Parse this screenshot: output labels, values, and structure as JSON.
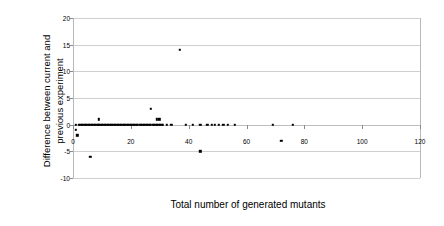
{
  "chart_data": {
    "type": "scatter",
    "title": "",
    "xlabel": "Total number of generated mutants",
    "ylabel": "Difference between current and previous experiment",
    "ylabel_line1": "Difference between current and",
    "ylabel_line2": "previous experiment",
    "xlim": [
      0,
      120
    ],
    "ylim": [
      -10,
      20
    ],
    "xticks": [
      0,
      20,
      40,
      60,
      80,
      100,
      120
    ],
    "yticks": [
      -10,
      -5,
      0,
      5,
      10,
      15,
      20
    ],
    "xtick_labels": [
      "0",
      "20",
      "40",
      "60",
      "80",
      "100",
      "120"
    ],
    "ytick_labels": [
      "-10",
      "-5",
      "0",
      "5",
      "10",
      "15",
      "20"
    ],
    "grid": "horizontal",
    "legend": "none",
    "marker": "square",
    "marker_color": "#000000",
    "marker_size": 2.4,
    "series": [
      {
        "name": "difference-per-mutant-count",
        "points": [
          [
            1,
            0
          ],
          [
            1,
            -1
          ],
          [
            1.5,
            -2
          ],
          [
            2,
            0
          ],
          [
            2.5,
            0
          ],
          [
            3,
            0
          ],
          [
            3.5,
            0
          ],
          [
            4,
            0
          ],
          [
            4.5,
            0
          ],
          [
            5,
            0
          ],
          [
            5.5,
            0
          ],
          [
            6,
            0
          ],
          [
            6,
            -6
          ],
          [
            6.5,
            0
          ],
          [
            7,
            0
          ],
          [
            7.5,
            0
          ],
          [
            8,
            0
          ],
          [
            8.5,
            0
          ],
          [
            9,
            1
          ],
          [
            9,
            0
          ],
          [
            9.5,
            0
          ],
          [
            10,
            0
          ],
          [
            10.5,
            0
          ],
          [
            11,
            0
          ],
          [
            11.5,
            0
          ],
          [
            12,
            0
          ],
          [
            12.5,
            0
          ],
          [
            13,
            0
          ],
          [
            13.5,
            0
          ],
          [
            14,
            0
          ],
          [
            14.5,
            0
          ],
          [
            15,
            0
          ],
          [
            15.5,
            0
          ],
          [
            16,
            0
          ],
          [
            16.5,
            0
          ],
          [
            17,
            0
          ],
          [
            17.5,
            0
          ],
          [
            18,
            0
          ],
          [
            18.5,
            0
          ],
          [
            19,
            0
          ],
          [
            19.5,
            0
          ],
          [
            20,
            0
          ],
          [
            20.5,
            0
          ],
          [
            21,
            0
          ],
          [
            21.5,
            0
          ],
          [
            22,
            0
          ],
          [
            22.5,
            0
          ],
          [
            23,
            0
          ],
          [
            23.5,
            0
          ],
          [
            24,
            0
          ],
          [
            24.5,
            0
          ],
          [
            25,
            0
          ],
          [
            25.5,
            0
          ],
          [
            26,
            0
          ],
          [
            26.5,
            0
          ],
          [
            27,
            3
          ],
          [
            27,
            0
          ],
          [
            27.5,
            0
          ],
          [
            28,
            0
          ],
          [
            28.5,
            0
          ],
          [
            29,
            1
          ],
          [
            29.8,
            1
          ],
          [
            29,
            0
          ],
          [
            29.5,
            0
          ],
          [
            30,
            0
          ],
          [
            30.5,
            0
          ],
          [
            31,
            0
          ],
          [
            32.5,
            0
          ],
          [
            34,
            0
          ],
          [
            37,
            14
          ],
          [
            39,
            0
          ],
          [
            41.5,
            0
          ],
          [
            44,
            -5
          ],
          [
            44,
            0
          ],
          [
            46.5,
            0
          ],
          [
            48,
            0
          ],
          [
            49,
            0
          ],
          [
            50.5,
            0
          ],
          [
            52,
            0
          ],
          [
            53.5,
            0
          ],
          [
            56,
            0
          ],
          [
            69,
            0
          ],
          [
            72,
            -3
          ],
          [
            76,
            0
          ]
        ]
      }
    ]
  }
}
